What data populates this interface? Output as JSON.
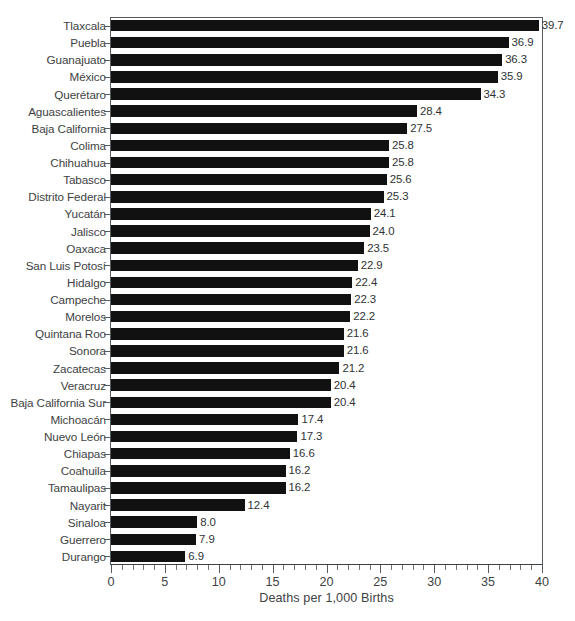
{
  "chart": {
    "type": "bar",
    "orientation": "horizontal",
    "title_remnant": "",
    "xlabel": "Deaths per 1,000 Births",
    "ylabel": "",
    "xlim": [
      0,
      40
    ],
    "xticks": [
      0,
      5,
      10,
      15,
      20,
      25,
      30,
      35,
      40
    ],
    "xtick_labels": [
      "0",
      "5",
      "10",
      "15",
      "20",
      "25",
      "30",
      "35",
      "40"
    ],
    "minor_tick_step": 1,
    "grid": false,
    "legend": null,
    "bar_color": "#111111",
    "axis_color": "#555b5e",
    "text_color": "#3e4244",
    "background": "#ffffff"
  },
  "chart_data": {
    "type": "bar",
    "title": "",
    "xlabel": "Deaths per 1,000 Births",
    "ylabel": "",
    "xlim": [
      0,
      40
    ],
    "grid": false,
    "orientation": "horizontal",
    "categories": [
      "Tlaxcala",
      "Puebla",
      "Guanajuato",
      "México",
      "Querétaro",
      "Aguascalientes",
      "Baja California",
      "Colima",
      "Chihuahua",
      "Tabasco",
      "Distrito Federal",
      "Yucatán",
      "Jalisco",
      "Oaxaca",
      "San Luis Potosí",
      "Hidalgo",
      "Campeche",
      "Morelos",
      "Quintana Roo",
      "Sonora",
      "Zacatecas",
      "Veracruz",
      "Baja California Sur",
      "Michoacán",
      "Nuevo León",
      "Chiapas",
      "Coahuila",
      "Tamaulipas",
      "Nayarit",
      "Sinaloa",
      "Guerrero",
      "Durango"
    ],
    "values": [
      39.7,
      36.9,
      36.3,
      35.9,
      34.3,
      28.4,
      27.5,
      25.8,
      25.8,
      25.6,
      25.3,
      24.1,
      24.0,
      23.5,
      22.9,
      22.4,
      22.3,
      22.2,
      21.6,
      21.6,
      21.2,
      20.4,
      20.4,
      17.4,
      17.3,
      16.6,
      16.2,
      16.2,
      12.4,
      8.0,
      7.9,
      6.9
    ],
    "value_labels": [
      "39.7",
      "36.9",
      "36.3",
      "35.9",
      "34.3",
      "28.4",
      "27.5",
      "25.8",
      "25.8",
      "25.6",
      "25.3",
      "24.1",
      "24.0",
      "23.5",
      "22.9",
      "22.4",
      "22.3",
      "22.2",
      "21.6",
      "21.6",
      "21.2",
      "20.4",
      "20.4",
      "17.4",
      "17.3",
      "16.6",
      "16.2",
      "16.2",
      "12.4",
      "8.0",
      "7.9",
      "6.9"
    ]
  }
}
